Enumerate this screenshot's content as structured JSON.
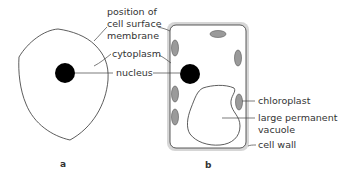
{
  "diagram": {
    "cells": [
      {
        "id": "a",
        "label": "a",
        "type": "animal cell"
      },
      {
        "id": "b",
        "label": "b",
        "type": "plant cell"
      }
    ],
    "labels": {
      "membrane_line1": "position of",
      "membrane_line2": "cell surface",
      "membrane_line3": "membrane",
      "cytoplasm": "cytoplasm",
      "nucleus": "nucleus",
      "chloroplast": "chloroplast",
      "vacuole_line1": "large permanent",
      "vacuole_line2": "vacuole",
      "cell_wall": "cell wall"
    },
    "colors": {
      "outline": "#333333",
      "nucleus": "#000000",
      "chloroplast_fill": "#9a9a9a",
      "cell_wall": "#d4d4d4",
      "leader_line": "#444444"
    }
  }
}
